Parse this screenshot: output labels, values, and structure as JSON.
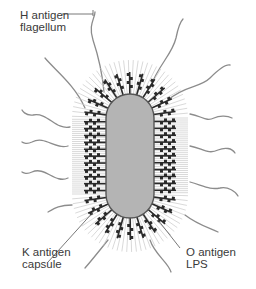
{
  "labels": {
    "h_antigen": {
      "line1": "H antigen",
      "line2": "flagellum"
    },
    "k_antigen": {
      "line1": "K antigen",
      "line2": "capsule"
    },
    "o_antigen": {
      "line1": "O antigen",
      "line2": "LPS"
    }
  },
  "colors": {
    "cell_body": "#b4b4b4",
    "cell_outline": "#555555",
    "capsule_rays": "#c8c8c8",
    "lps_chains": "#2a2a2a",
    "flagella": "#8c8c8c",
    "leader_lines": "#555555",
    "text": "#3a3a3a"
  }
}
